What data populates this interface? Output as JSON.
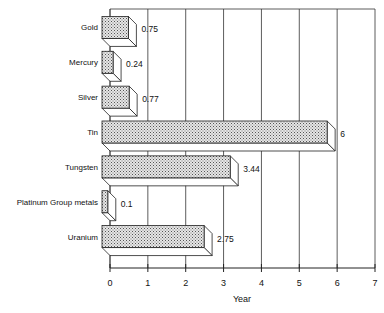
{
  "chart_data": {
    "type": "bar",
    "orientation": "horizontal",
    "style": "3d",
    "title": "",
    "xlabel": "Year",
    "ylabel": "",
    "categories": [
      "Gold",
      "Mercury",
      "Silver",
      "Tin",
      "Tungsten",
      "Platinum Group metals",
      "Uranium"
    ],
    "values": [
      0.75,
      0.24,
      0.77,
      6,
      3.44,
      0.1,
      2.75
    ],
    "data_labels": [
      "0.75",
      "0.24",
      "0.77",
      "6",
      "3.44",
      "0.1",
      "2.75"
    ],
    "xlim": [
      0,
      7
    ],
    "xticks": [
      "0",
      "1",
      "2",
      "3",
      "4",
      "5",
      "6",
      "7"
    ],
    "grid": "vertical",
    "legend": "none",
    "colors": {
      "bar_fill": "#c8c8c8",
      "bar_stroke": "#222222",
      "grid": "#333333"
    }
  }
}
